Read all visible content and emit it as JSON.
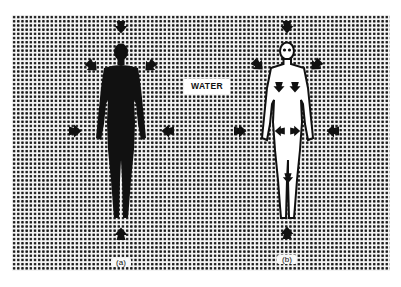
{
  "figure": {
    "labels": {
      "medium": "WATER",
      "panel_a": "(a)",
      "panel_b": "(b)"
    },
    "panels": [
      {
        "id": "a",
        "style": "solid-silhouette",
        "arrows": [
          "top",
          "upper-left",
          "upper-right",
          "left",
          "right",
          "bottom"
        ]
      },
      {
        "id": "b",
        "style": "outline-with-internal-arrows",
        "arrows": [
          "top",
          "upper-left",
          "upper-right",
          "left",
          "right",
          "bottom"
        ],
        "internal_arrows": [
          "chest-left",
          "chest-right",
          "hip-left",
          "hip-right",
          "leg-down"
        ]
      }
    ],
    "colors": {
      "ink": "#111111",
      "paper": "#ffffff",
      "halftone_dot": "#1a1a1a"
    }
  }
}
